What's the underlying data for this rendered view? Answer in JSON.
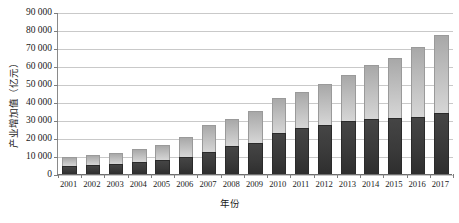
{
  "chart_data": {
    "type": "bar",
    "stacked": true,
    "title": "",
    "xlabel": "年份",
    "ylabel": "产业增加值（亿元）",
    "ylim": [
      0,
      90000
    ],
    "ytick_step": 10000,
    "ytick_labels": [
      "0",
      "10 000",
      "20 000",
      "30 000",
      "40 000",
      "50 000",
      "60 000",
      "70 000",
      "80 000",
      "90 000"
    ],
    "ytick_values": [
      0,
      10000,
      20000,
      30000,
      40000,
      50000,
      60000,
      70000,
      80000,
      90000
    ],
    "grid": true,
    "legend": "none",
    "categories": [
      "2001",
      "2002",
      "2003",
      "2004",
      "2005",
      "2006",
      "2007",
      "2008",
      "2009",
      "2010",
      "2011",
      "2012",
      "2013",
      "2014",
      "2015",
      "2016",
      "2017"
    ],
    "series": [
      {
        "name": "下层（深色）",
        "color": "#383838",
        "values": [
          4600,
          5000,
          5300,
          6400,
          7800,
          9400,
          12200,
          15300,
          17200,
          22800,
          25600,
          27200,
          29400,
          30400,
          31200,
          31800,
          34000
        ]
      },
      {
        "name": "上层（浅色）",
        "color": "#bcbcbc",
        "values": [
          4800,
          5800,
          6400,
          7400,
          8200,
          11000,
          15000,
          15400,
          17600,
          19400,
          20000,
          23000,
          25500,
          30000,
          33500,
          38500,
          43500
        ]
      }
    ],
    "totals": [
      9400,
      10800,
      11700,
      13800,
      16000,
      20400,
      27200,
      30700,
      34800,
      42200,
      45600,
      50200,
      54900,
      60400,
      64700,
      70300,
      77500
    ]
  }
}
